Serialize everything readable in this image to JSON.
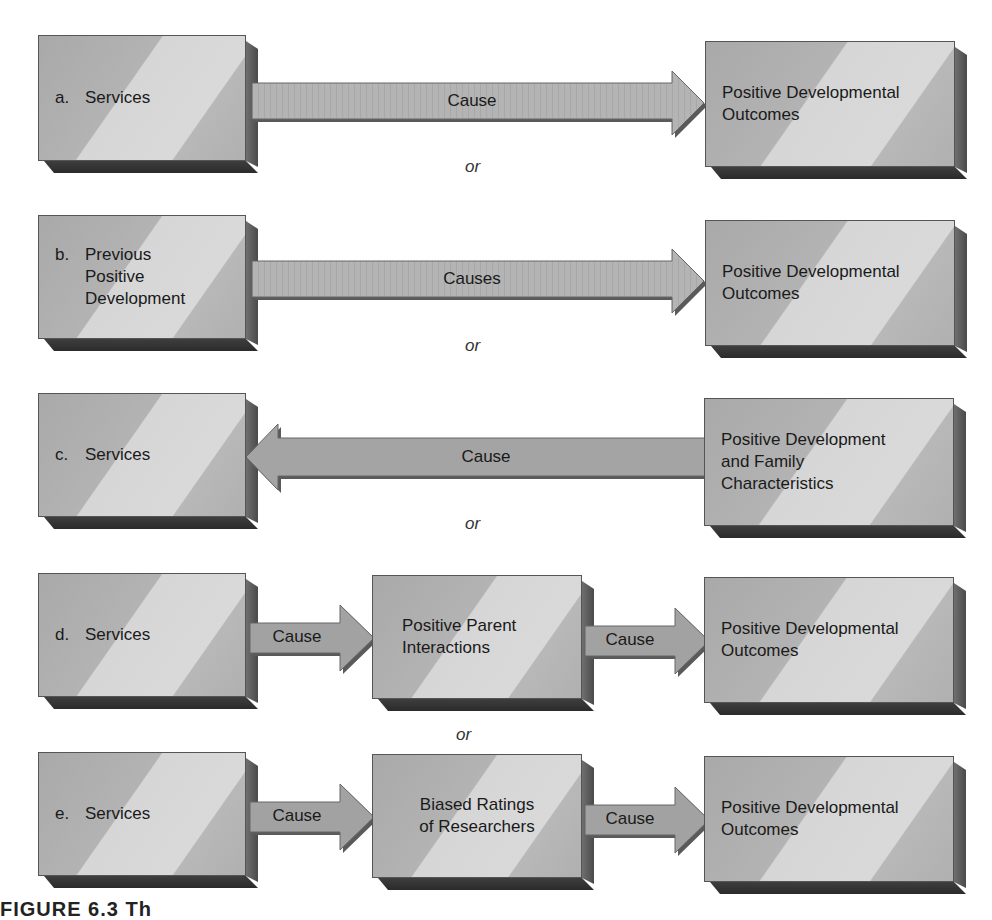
{
  "figure": {
    "caption_fragment": "FIGURE 6.3  Th",
    "connector_word": "or",
    "rows": [
      {
        "id": "a",
        "letter": "a.",
        "source": "Services",
        "arrow_label": "Cause",
        "arrow_direction": "right",
        "target": "Positive Developmental\nOutcomes"
      },
      {
        "id": "b",
        "letter": "b.",
        "source": "Previous\nPositive\nDevelopment",
        "arrow_label": "Causes",
        "arrow_direction": "right",
        "target": "Positive Developmental\nOutcomes"
      },
      {
        "id": "c",
        "letter": "c.",
        "source": "Services",
        "arrow_label": "Cause",
        "arrow_direction": "left",
        "target": "Positive Development\nand Family\nCharacteristics"
      },
      {
        "id": "d",
        "letter": "d.",
        "source": "Services",
        "arrow1_label": "Cause",
        "mediator": "Positive Parent\nInteractions",
        "arrow2_label": "Cause",
        "target": "Positive Developmental\nOutcomes"
      },
      {
        "id": "e",
        "letter": "e.",
        "source": "Services",
        "arrow1_label": "Cause",
        "mediator": "Biased Ratings\nof Researchers",
        "arrow2_label": "Cause",
        "target": "Positive Developmental\nOutcomes"
      }
    ]
  },
  "colors": {
    "box_face_dark": "#a9a9a9",
    "box_face_light": "#d9d9d9",
    "box_depth": "#3e3e3e",
    "arrow_fill": "#9a9a9a",
    "arrow_long_fill": "#b0b0b0",
    "text": "#1a1a1a"
  }
}
